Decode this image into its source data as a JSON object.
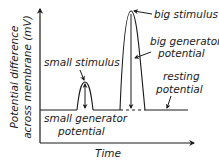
{
  "diagram": {
    "y_axis_label_line1": "Potential difference",
    "y_axis_label_line2": "across membrane (mV)",
    "x_axis_label": "Time",
    "labels": {
      "small_stimulus": "small stimulus",
      "big_stimulus": "big stimulus",
      "big_generator_line1": "big generator",
      "big_generator_line2": "potential",
      "resting_line1": "resting",
      "resting_line2": "potential",
      "small_generator_line1": "small generator",
      "small_generator_line2": "potential"
    },
    "colors": {
      "line": "#1a1a1a",
      "background": "#ffffff"
    }
  }
}
